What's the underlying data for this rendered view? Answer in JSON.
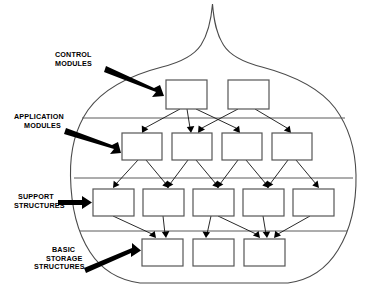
{
  "diagram": {
    "shape_name": "onion-outline",
    "colors": {
      "background": "#ffffff",
      "outline": "#4a4a4a",
      "box_stroke": "#555555",
      "box_fill": "#ffffff",
      "connector": "#111111",
      "callout": "#000000",
      "text": "#000000"
    },
    "callouts": [
      {
        "id": "control-modules",
        "lines": [
          "CONTROL",
          "MODULES"
        ],
        "text_x": 55,
        "text_y": 57,
        "arrow_from": [
          108,
          70
        ],
        "arrow_to": [
          163,
          94
        ]
      },
      {
        "id": "application-modules",
        "lines": [
          "APPLICATION",
          "MODULES"
        ],
        "text_x": 14,
        "text_y": 119,
        "arrow_from": [
          68,
          131
        ],
        "arrow_to": [
          122,
          151
        ]
      },
      {
        "id": "support-structures",
        "lines": [
          "SUPPORT",
          "STRUCTURES"
        ],
        "text_x": 14,
        "text_y": 202,
        "arrow_from": [
          54,
          203
        ],
        "arrow_to": [
          93,
          203
        ]
      },
      {
        "id": "basic-storage-structures",
        "lines": [
          "BASIC",
          "STORAGE",
          "STRUCTURES"
        ],
        "text_x": 40,
        "text_y": 258,
        "arrow_from": [
          85,
          270
        ],
        "arrow_to": [
          142,
          252
        ]
      }
    ],
    "dividers": [
      {
        "id": "divider-control-application",
        "y": 118,
        "x1": 77,
        "x2": 348
      },
      {
        "id": "divider-application-support",
        "y": 178,
        "x1": 74,
        "x2": 351
      },
      {
        "id": "divider-support-basic",
        "y": 231,
        "x1": 78,
        "x2": 348
      }
    ],
    "layers": [
      {
        "id": "layer-control-modules",
        "name": "CONTROL MODULES",
        "boxes": [
          {
            "id": "control-box-1",
            "x": 166,
            "y": 80,
            "w": 41,
            "h": 29
          },
          {
            "id": "control-box-2",
            "x": 228,
            "y": 80,
            "w": 41,
            "h": 29
          }
        ]
      },
      {
        "id": "layer-application-modules",
        "name": "APPLICATION MODULES",
        "boxes": [
          {
            "id": "application-box-1",
            "x": 122,
            "y": 133,
            "w": 40,
            "h": 27
          },
          {
            "id": "application-box-2",
            "x": 172,
            "y": 133,
            "w": 40,
            "h": 27
          },
          {
            "id": "application-box-3",
            "x": 222,
            "y": 133,
            "w": 40,
            "h": 27
          },
          {
            "id": "application-box-4",
            "x": 272,
            "y": 133,
            "w": 40,
            "h": 27
          }
        ]
      },
      {
        "id": "layer-support-structures",
        "name": "SUPPORT STRUCTURES",
        "boxes": [
          {
            "id": "support-box-1",
            "x": 93,
            "y": 189,
            "w": 41,
            "h": 27
          },
          {
            "id": "support-box-2",
            "x": 143,
            "y": 189,
            "w": 41,
            "h": 27
          },
          {
            "id": "support-box-3",
            "x": 193,
            "y": 189,
            "w": 41,
            "h": 27
          },
          {
            "id": "support-box-4",
            "x": 243,
            "y": 189,
            "w": 41,
            "h": 27
          },
          {
            "id": "support-box-5",
            "x": 293,
            "y": 189,
            "w": 41,
            "h": 27
          }
        ]
      },
      {
        "id": "layer-basic-storage-structures",
        "name": "BASIC STORAGE STRUCTURES",
        "boxes": [
          {
            "id": "storage-box-1",
            "x": 142,
            "y": 239,
            "w": 41,
            "h": 27
          },
          {
            "id": "storage-box-2",
            "x": 193,
            "y": 239,
            "w": 41,
            "h": 27
          },
          {
            "id": "storage-box-3",
            "x": 244,
            "y": 239,
            "w": 41,
            "h": 27
          }
        ]
      }
    ],
    "connectors": [
      {
        "from": "control-box-1",
        "to": "application-box-1"
      },
      {
        "from": "control-box-1",
        "to": "application-box-2"
      },
      {
        "from": "control-box-1",
        "to": "application-box-3"
      },
      {
        "from": "control-box-2",
        "to": "application-box-2"
      },
      {
        "from": "control-box-2",
        "to": "application-box-4"
      },
      {
        "from": "application-box-1",
        "to": "support-box-1"
      },
      {
        "from": "application-box-1",
        "to": "support-box-2"
      },
      {
        "from": "application-box-2",
        "to": "support-box-2"
      },
      {
        "from": "application-box-2",
        "to": "support-box-3"
      },
      {
        "from": "application-box-3",
        "to": "support-box-3"
      },
      {
        "from": "application-box-3",
        "to": "support-box-4"
      },
      {
        "from": "application-box-4",
        "to": "support-box-4"
      },
      {
        "from": "application-box-4",
        "to": "support-box-5"
      },
      {
        "from": "support-box-1",
        "to": "storage-box-1"
      },
      {
        "from": "support-box-2",
        "to": "storage-box-1"
      },
      {
        "from": "support-box-3",
        "to": "storage-box-2"
      },
      {
        "from": "support-box-3",
        "to": "storage-box-3"
      },
      {
        "from": "support-box-4",
        "to": "storage-box-3"
      },
      {
        "from": "support-box-5",
        "to": "storage-box-3"
      }
    ]
  }
}
